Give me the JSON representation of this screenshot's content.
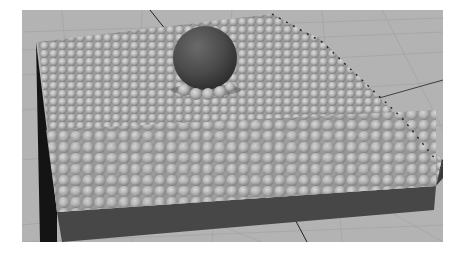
{
  "scene": {
    "description": "3D viewport render: open box filled with many small spheres and one large dark sphere resting on top",
    "colors": {
      "background": "#ffffff",
      "ground": "#b3b3b3",
      "grid_line": "#a2a2a2",
      "box_side": "#4a4a4a",
      "box_edge_dark": "#111111",
      "small_sphere": "#b8b8b8",
      "small_sphere_shade": "#8a8a8a",
      "big_sphere": "#4b4b4b"
    },
    "objects": [
      {
        "name": "ground-grid"
      },
      {
        "name": "container-box"
      },
      {
        "name": "small-spheres-pile"
      },
      {
        "name": "large-sphere"
      }
    ]
  }
}
